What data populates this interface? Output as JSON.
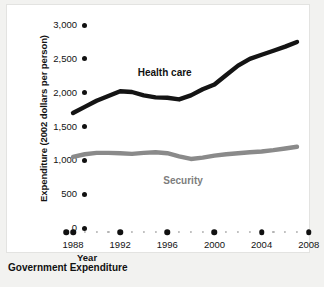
{
  "caption": "Government Expenditure",
  "axes": {
    "ylabel": "Expenditure (2002 dollars per person)",
    "xlabel": "Year"
  },
  "series_labels": {
    "health": "Health care",
    "security": "Security"
  },
  "colors": {
    "health": "#141414",
    "security": "#8a8a8a",
    "tick": "#111111",
    "minor_tick": "#b4b4b4",
    "panel": "#ffffff",
    "page": "#f2f2f0"
  },
  "chart_data": {
    "type": "line",
    "title": "Government Expenditure",
    "xlabel": "Year",
    "ylabel": "Expenditure (2002 dollars per person)",
    "xlim": [
      1987,
      2008
    ],
    "ylim": [
      0,
      3000
    ],
    "ytick_labels": [
      "0",
      "500",
      "1,000",
      "1,500",
      "2,000",
      "2,500",
      "3,000"
    ],
    "yticks": [
      0,
      500,
      1000,
      1500,
      2000,
      2500,
      3000
    ],
    "xtick_labels": [
      "1988",
      "1992",
      "1996",
      "2000",
      "2004",
      "2008"
    ],
    "xticks": [
      1988,
      1992,
      1996,
      2000,
      2004,
      2008
    ],
    "grid": false,
    "legend": "inline-labels",
    "x": [
      1988,
      1989,
      1990,
      1991,
      1992,
      1993,
      1994,
      1995,
      1996,
      1997,
      1998,
      1999,
      2000,
      2001,
      2002,
      2003,
      2004,
      2005,
      2006,
      2007
    ],
    "series": [
      {
        "name": "Health care",
        "color": "#141414",
        "values": [
          1700,
          1790,
          1880,
          1950,
          2020,
          2010,
          1960,
          1930,
          1925,
          1900,
          1960,
          2050,
          2120,
          2260,
          2400,
          2500,
          2560,
          2620,
          2680,
          2750
        ]
      },
      {
        "name": "Security",
        "color": "#8a8a8a",
        "values": [
          1050,
          1090,
          1110,
          1110,
          1105,
          1095,
          1110,
          1120,
          1105,
          1060,
          1020,
          1040,
          1070,
          1090,
          1105,
          1120,
          1130,
          1150,
          1175,
          1200
        ]
      }
    ]
  }
}
